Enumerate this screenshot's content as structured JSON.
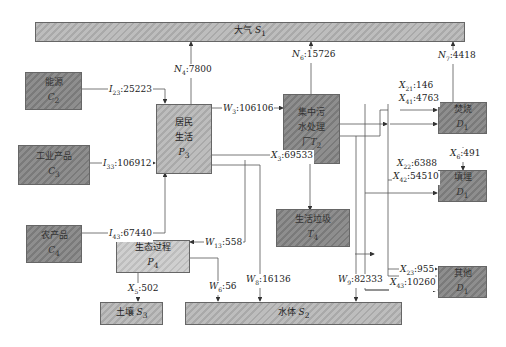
{
  "nodes": {
    "atmosphere": {
      "name": "大气",
      "symbol": "S",
      "sub": "1"
    },
    "energy": {
      "name": "能源",
      "symbol": "C",
      "sub": "2"
    },
    "industrial": {
      "name": "工业产品",
      "symbol": "C",
      "sub": "3"
    },
    "agri": {
      "name": "农产品",
      "symbol": "C",
      "sub": "4"
    },
    "residents": {
      "name1": "居民",
      "name2": "生活",
      "symbol": "P",
      "sub": "3"
    },
    "eco": {
      "name": "生态过程",
      "symbol": "P",
      "sub": "4"
    },
    "wwtp": {
      "name1": "集中污",
      "name2": "水处理",
      "name3": "厂",
      "symbol": "T",
      "sub": "2"
    },
    "waste": {
      "name": "生活垃圾",
      "symbol": "T",
      "sub": "4"
    },
    "incinerate": {
      "name": "焚烧",
      "symbol": "D",
      "sub": "1"
    },
    "landfill": {
      "name": "填埋",
      "symbol": "D",
      "sub": "1"
    },
    "other": {
      "name": "其他",
      "symbol": "D",
      "sub": "1"
    },
    "soil": {
      "name": "土壤",
      "symbol": "S",
      "sub": "3"
    },
    "water": {
      "name": "水体",
      "symbol": "S",
      "sub": "2"
    }
  },
  "flows": {
    "I23": {
      "v": "I",
      "s": "23",
      "val": ":25223"
    },
    "I33": {
      "v": "I",
      "s": "33",
      "val": ":106912"
    },
    "I43": {
      "v": "I",
      "s": "43",
      "val": ":67440"
    },
    "N4": {
      "v": "N",
      "s": "4",
      "val": ":7800"
    },
    "N6": {
      "v": "N",
      "s": "6",
      "val": ":15726"
    },
    "N7": {
      "v": "N",
      "s": "7",
      "val": ":4418"
    },
    "W3": {
      "v": "W",
      "s": "3",
      "val": ":106106"
    },
    "X3": {
      "v": "X",
      "s": "3",
      "val": ":69533"
    },
    "X21": {
      "v": "X",
      "s": "21",
      "val": ":146"
    },
    "X41": {
      "v": "X",
      "s": "41",
      "val": ":4763"
    },
    "X6": {
      "v": "X",
      "s": "6",
      "val": ":491"
    },
    "X22": {
      "v": "X",
      "s": "22",
      "val": ":6388"
    },
    "X42": {
      "v": "X",
      "s": "42",
      "val": ":54510"
    },
    "X23": {
      "v": "X",
      "s": "23",
      "val": ":955"
    },
    "X43": {
      "v": "X",
      "s": "43",
      "val": ":10260"
    },
    "W13": {
      "v": "W",
      "s": "13",
      "val": ":558"
    },
    "X5": {
      "v": "X",
      "s": "5",
      "val": ":502"
    },
    "W6": {
      "v": "W",
      "s": "6",
      "val": ":56"
    },
    "W8": {
      "v": "W",
      "s": "8",
      "val": ":16136"
    },
    "W9": {
      "v": "W",
      "s": "9",
      "val": ":82333"
    }
  }
}
